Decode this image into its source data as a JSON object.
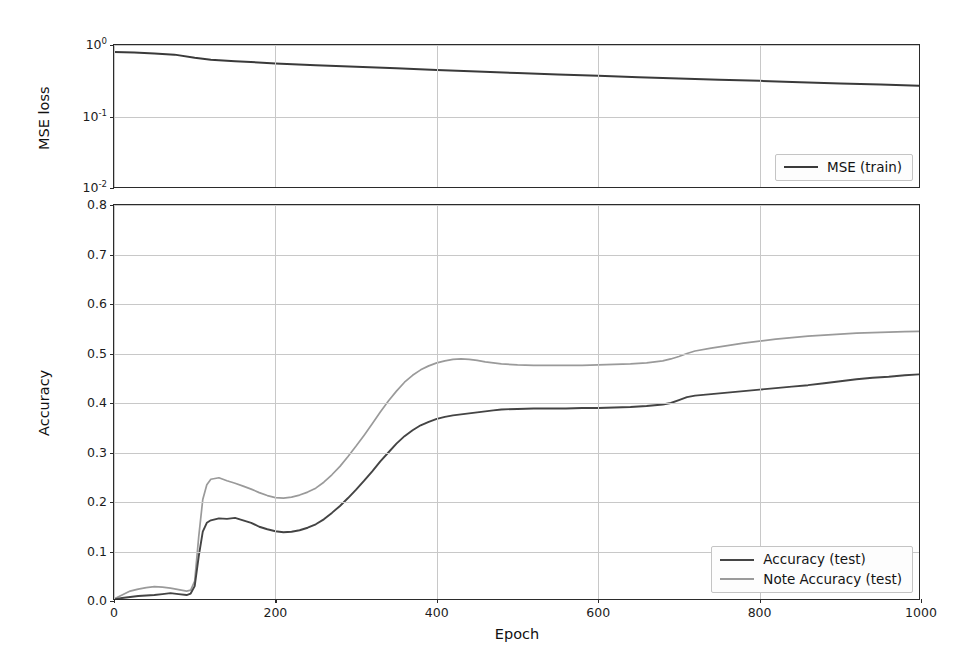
{
  "figure": {
    "width": 965,
    "height": 664,
    "background": "#ffffff"
  },
  "colors": {
    "mse_train": "#3a3a3a",
    "accuracy_test": "#444444",
    "note_accuracy_test": "#9a9a9a",
    "axis": "#2b2b2b",
    "grid": "#c8c8c8"
  },
  "top_panel": {
    "ylabel": "MSE loss",
    "yticks": [
      "10",
      "10",
      "10"
    ],
    "ytick_exponents": [
      "0",
      "-1",
      "-2"
    ],
    "legend": {
      "items": [
        {
          "label": "MSE (train)",
          "color": "#3a3a3a"
        }
      ]
    }
  },
  "bottom_panel": {
    "ylabel": "Accuracy",
    "xlabel": "Epoch",
    "yticks": [
      "0.0",
      "0.1",
      "0.2",
      "0.3",
      "0.4",
      "0.5",
      "0.6",
      "0.7",
      "0.8"
    ],
    "xticks": [
      "0",
      "200",
      "400",
      "600",
      "800",
      "1000"
    ],
    "legend": {
      "items": [
        {
          "label": "Accuracy (test)",
          "color": "#444444"
        },
        {
          "label": "Note Accuracy (test)",
          "color": "#9a9a9a"
        }
      ]
    }
  },
  "chart_data": [
    {
      "type": "line",
      "title": "",
      "xlabel": "",
      "ylabel": "MSE loss",
      "yscale": "log",
      "xlim": [
        0,
        1000
      ],
      "ylim": [
        0.01,
        1.0
      ],
      "grid": true,
      "legend_position": "lower right",
      "x": [
        0,
        25,
        50,
        75,
        100,
        120,
        150,
        200,
        250,
        300,
        350,
        400,
        450,
        500,
        550,
        600,
        650,
        700,
        750,
        800,
        850,
        900,
        950,
        1000
      ],
      "series": [
        {
          "name": "MSE (train)",
          "color": "#3a3a3a",
          "values": [
            0.8,
            0.785,
            0.765,
            0.735,
            0.665,
            0.625,
            0.595,
            0.555,
            0.525,
            0.5,
            0.475,
            0.45,
            0.428,
            0.408,
            0.39,
            0.373,
            0.357,
            0.343,
            0.33,
            0.318,
            0.305,
            0.293,
            0.283,
            0.272
          ]
        }
      ]
    },
    {
      "type": "line",
      "title": "",
      "xlabel": "Epoch",
      "ylabel": "Accuracy",
      "yscale": "linear",
      "xlim": [
        0,
        1000
      ],
      "ylim": [
        0.0,
        0.8
      ],
      "grid": true,
      "legend_position": "lower right",
      "x": [
        0,
        10,
        20,
        30,
        40,
        50,
        60,
        70,
        80,
        90,
        95,
        100,
        105,
        110,
        115,
        120,
        130,
        140,
        150,
        160,
        170,
        180,
        190,
        200,
        210,
        220,
        230,
        240,
        250,
        260,
        270,
        280,
        290,
        300,
        310,
        320,
        330,
        340,
        350,
        360,
        370,
        380,
        390,
        400,
        410,
        420,
        430,
        440,
        450,
        460,
        470,
        480,
        500,
        520,
        540,
        560,
        580,
        600,
        620,
        640,
        660,
        680,
        690,
        700,
        710,
        720,
        740,
        760,
        780,
        800,
        820,
        840,
        860,
        880,
        900,
        920,
        940,
        960,
        980,
        1000
      ],
      "series": [
        {
          "name": "Accuracy (test)",
          "color": "#444444",
          "values": [
            0.003,
            0.006,
            0.008,
            0.01,
            0.011,
            0.012,
            0.014,
            0.016,
            0.014,
            0.012,
            0.015,
            0.03,
            0.09,
            0.14,
            0.158,
            0.163,
            0.167,
            0.166,
            0.168,
            0.163,
            0.158,
            0.15,
            0.145,
            0.141,
            0.139,
            0.14,
            0.143,
            0.148,
            0.155,
            0.165,
            0.178,
            0.192,
            0.208,
            0.225,
            0.243,
            0.262,
            0.282,
            0.3,
            0.318,
            0.333,
            0.345,
            0.355,
            0.362,
            0.368,
            0.372,
            0.375,
            0.377,
            0.379,
            0.381,
            0.383,
            0.385,
            0.387,
            0.388,
            0.389,
            0.389,
            0.389,
            0.39,
            0.39,
            0.391,
            0.392,
            0.394,
            0.397,
            0.4,
            0.406,
            0.412,
            0.415,
            0.418,
            0.421,
            0.424,
            0.427,
            0.43,
            0.433,
            0.436,
            0.44,
            0.444,
            0.448,
            0.451,
            0.453,
            0.456,
            0.458
          ]
        },
        {
          "name": "Note Accuracy (test)",
          "color": "#9a9a9a",
          "values": [
            0.004,
            0.012,
            0.02,
            0.024,
            0.027,
            0.029,
            0.028,
            0.026,
            0.023,
            0.02,
            0.022,
            0.04,
            0.13,
            0.205,
            0.235,
            0.246,
            0.249,
            0.243,
            0.238,
            0.232,
            0.226,
            0.219,
            0.213,
            0.209,
            0.208,
            0.21,
            0.214,
            0.22,
            0.228,
            0.24,
            0.255,
            0.272,
            0.292,
            0.313,
            0.335,
            0.358,
            0.382,
            0.404,
            0.424,
            0.442,
            0.456,
            0.467,
            0.475,
            0.481,
            0.485,
            0.488,
            0.489,
            0.488,
            0.486,
            0.483,
            0.481,
            0.479,
            0.477,
            0.476,
            0.476,
            0.476,
            0.476,
            0.477,
            0.478,
            0.479,
            0.481,
            0.485,
            0.489,
            0.494,
            0.5,
            0.505,
            0.511,
            0.516,
            0.521,
            0.525,
            0.529,
            0.532,
            0.535,
            0.537,
            0.539,
            0.541,
            0.542,
            0.543,
            0.544,
            0.545
          ]
        }
      ]
    }
  ]
}
